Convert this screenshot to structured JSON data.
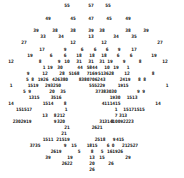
{
  "diagram": {
    "type": "number-tree",
    "text_color": "#111111",
    "background": "#ffffff",
    "labels": [
      {
        "t": "55",
        "x": 67,
        "y": 5
      },
      {
        "t": "57",
        "x": 91,
        "y": 5
      },
      {
        "t": "55",
        "x": 108,
        "y": 5
      },
      {
        "t": "49",
        "x": 48,
        "y": 18
      },
      {
        "t": "45",
        "x": 73,
        "y": 18
      },
      {
        "t": "47",
        "x": 91,
        "y": 18
      },
      {
        "t": "45",
        "x": 109,
        "y": 18
      },
      {
        "t": "49",
        "x": 128,
        "y": 18
      },
      {
        "t": "39",
        "x": 36,
        "y": 30
      },
      {
        "t": "38",
        "x": 55,
        "y": 30
      },
      {
        "t": "38",
        "x": 73,
        "y": 30
      },
      {
        "t": "39",
        "x": 91,
        "y": 30
      },
      {
        "t": "38",
        "x": 102,
        "y": 30
      },
      {
        "t": "38",
        "x": 128,
        "y": 30
      },
      {
        "t": "39",
        "x": 146,
        "y": 30
      },
      {
        "t": "33",
        "x": 43,
        "y": 36
      },
      {
        "t": "34",
        "x": 61,
        "y": 36
      },
      {
        "t": "13",
        "x": 91,
        "y": 36
      },
      {
        "t": "34",
        "x": 116,
        "y": 36
      },
      {
        "t": "35",
        "x": 134,
        "y": 36
      },
      {
        "t": "27",
        "x": 24,
        "y": 42
      },
      {
        "t": "12",
        "x": 73,
        "y": 42
      },
      {
        "t": "12",
        "x": 104,
        "y": 42
      },
      {
        "t": "27",
        "x": 160,
        "y": 42
      },
      {
        "t": "17",
        "x": 42,
        "y": 49
      },
      {
        "t": "9",
        "x": 65,
        "y": 49
      },
      {
        "t": "6",
        "x": 82,
        "y": 49
      },
      {
        "t": "6",
        "x": 95,
        "y": 49
      },
      {
        "t": "6",
        "x": 107,
        "y": 49
      },
      {
        "t": "9",
        "x": 119,
        "y": 49
      },
      {
        "t": "17",
        "x": 134,
        "y": 49
      },
      {
        "t": "19",
        "x": 30,
        "y": 55
      },
      {
        "t": "6",
        "x": 51,
        "y": 55
      },
      {
        "t": "6",
        "x": 65,
        "y": 55
      },
      {
        "t": "18",
        "x": 79,
        "y": 55
      },
      {
        "t": "18",
        "x": 92,
        "y": 55
      },
      {
        "t": "18",
        "x": 104,
        "y": 55
      },
      {
        "t": "6",
        "x": 118,
        "y": 55
      },
      {
        "t": "6",
        "x": 131,
        "y": 55
      },
      {
        "t": "19",
        "x": 154,
        "y": 55
      },
      {
        "t": "12",
        "x": 11,
        "y": 61
      },
      {
        "t": "8",
        "x": 40,
        "y": 61
      },
      {
        "t": "9",
        "x": 59,
        "y": 61
      },
      {
        "t": "10",
        "x": 67,
        "y": 61
      },
      {
        "t": "31",
        "x": 79,
        "y": 61
      },
      {
        "t": "31",
        "x": 91,
        "y": 61
      },
      {
        "t": "31",
        "x": 102,
        "y": 61
      },
      {
        "t": "19",
        "x": 110,
        "y": 61
      },
      {
        "t": "9",
        "x": 124,
        "y": 61
      },
      {
        "t": "8",
        "x": 140,
        "y": 61
      },
      {
        "t": "12",
        "x": 165,
        "y": 61
      },
      {
        "t": "1",
        "x": 44,
        "y": 67
      },
      {
        "t": "19",
        "x": 50,
        "y": 67
      },
      {
        "t": "30",
        "x": 60,
        "y": 67
      },
      {
        "t": "44",
        "x": 80,
        "y": 67
      },
      {
        "t": "5844",
        "x": 92,
        "y": 67
      },
      {
        "t": "10",
        "x": 107,
        "y": 67
      },
      {
        "t": "19",
        "x": 116,
        "y": 67
      },
      {
        "t": "1",
        "x": 128,
        "y": 67
      },
      {
        "t": "9",
        "x": 28,
        "y": 73
      },
      {
        "t": "12",
        "x": 45,
        "y": 73
      },
      {
        "t": "28",
        "x": 62,
        "y": 73
      },
      {
        "t": "5168",
        "x": 74,
        "y": 73
      },
      {
        "t": "7169",
        "x": 92,
        "y": 73
      },
      {
        "t": "513628",
        "x": 106,
        "y": 73
      },
      {
        "t": "12",
        "x": 127,
        "y": 73
      },
      {
        "t": "8",
        "x": 153,
        "y": 73
      },
      {
        "t": "5 8",
        "x": 30,
        "y": 79
      },
      {
        "t": "1926",
        "x": 43,
        "y": 79
      },
      {
        "t": "426380",
        "x": 60,
        "y": 79
      },
      {
        "t": "8380706243",
        "x": 92,
        "y": 79
      },
      {
        "t": "2419",
        "x": 125,
        "y": 79
      },
      {
        "t": "8 8",
        "x": 142,
        "y": 79
      },
      {
        "t": "1",
        "x": 11,
        "y": 85
      },
      {
        "t": "1519",
        "x": 33,
        "y": 85
      },
      {
        "t": "293250",
        "x": 53,
        "y": 85
      },
      {
        "t": "555229",
        "x": 97,
        "y": 85
      },
      {
        "t": "1915",
        "x": 123,
        "y": 85
      },
      {
        "t": "1",
        "x": 167,
        "y": 85
      },
      {
        "t": "5 9",
        "x": 27,
        "y": 91
      },
      {
        "t": "20",
        "x": 52,
        "y": 91
      },
      {
        "t": "35",
        "x": 63,
        "y": 91
      },
      {
        "t": "37383030",
        "x": 106,
        "y": 91
      },
      {
        "t": "9 9",
        "x": 141,
        "y": 91
      },
      {
        "t": "1315",
        "x": 34,
        "y": 97
      },
      {
        "t": "3516",
        "x": 56,
        "y": 97
      },
      {
        "t": "1930",
        "x": 115,
        "y": 97
      },
      {
        "t": "1513",
        "x": 132,
        "y": 97
      },
      {
        "t": "14",
        "x": 11,
        "y": 103
      },
      {
        "t": "1514",
        "x": 48,
        "y": 103
      },
      {
        "t": "8",
        "x": 65,
        "y": 103
      },
      {
        "t": "4111415",
        "x": 111,
        "y": 103
      },
      {
        "t": "14",
        "x": 158,
        "y": 103
      },
      {
        "t": "151517",
        "x": 24,
        "y": 109
      },
      {
        "t": "1",
        "x": 66,
        "y": 109
      },
      {
        "t": "1",
        "x": 116,
        "y": 109
      },
      {
        "t": "15171515",
        "x": 134,
        "y": 109
      },
      {
        "t": "13",
        "x": 45,
        "y": 115
      },
      {
        "t": "8",
        "x": 55,
        "y": 115
      },
      {
        "t": "212",
        "x": 61,
        "y": 115
      },
      {
        "t": "7",
        "x": 116,
        "y": 115
      },
      {
        "t": "313",
        "x": 123,
        "y": 115
      },
      {
        "t": "2302919",
        "x": 22,
        "y": 121
      },
      {
        "t": "9",
        "x": 55,
        "y": 121
      },
      {
        "t": "320",
        "x": 61,
        "y": 121
      },
      {
        "t": "31",
        "x": 102,
        "y": 121
      },
      {
        "t": "3",
        "x": 112,
        "y": 121
      },
      {
        "t": "31410092223",
        "x": 119,
        "y": 121
      },
      {
        "t": "21",
        "x": 67,
        "y": 127
      },
      {
        "t": "2621",
        "x": 97,
        "y": 127
      },
      {
        "t": "21",
        "x": 64,
        "y": 133
      },
      {
        "t": "1511",
        "x": 48,
        "y": 139
      },
      {
        "t": "21519",
        "x": 63,
        "y": 139
      },
      {
        "t": "2518",
        "x": 100,
        "y": 139
      },
      {
        "t": "9",
        "x": 114,
        "y": 139
      },
      {
        "t": "415",
        "x": 120,
        "y": 139
      },
      {
        "t": "3735",
        "x": 35,
        "y": 145
      },
      {
        "t": "9",
        "x": 65,
        "y": 145
      },
      {
        "t": "15",
        "x": 74,
        "y": 145
      },
      {
        "t": "1815",
        "x": 92,
        "y": 145
      },
      {
        "t": "6",
        "x": 108,
        "y": 145
      },
      {
        "t": "0",
        "x": 113,
        "y": 145
      },
      {
        "t": "212527",
        "x": 130,
        "y": 145
      },
      {
        "t": "2619",
        "x": 56,
        "y": 151
      },
      {
        "t": "5",
        "x": 79,
        "y": 151
      },
      {
        "t": "8",
        "x": 92,
        "y": 151
      },
      {
        "t": "5",
        "x": 102,
        "y": 151
      },
      {
        "t": "161926",
        "x": 115,
        "y": 151
      },
      {
        "t": "39",
        "x": 48,
        "y": 157
      },
      {
        "t": "19",
        "x": 70,
        "y": 157
      },
      {
        "t": "13",
        "x": 92,
        "y": 157
      },
      {
        "t": "15",
        "x": 102,
        "y": 157
      },
      {
        "t": "29",
        "x": 128,
        "y": 157
      },
      {
        "t": "2622",
        "x": 67,
        "y": 163
      },
      {
        "t": "20",
        "x": 92,
        "y": 163
      },
      {
        "t": "26",
        "x": 111,
        "y": 163
      },
      {
        "t": "26",
        "x": 92,
        "y": 169
      }
    ]
  }
}
